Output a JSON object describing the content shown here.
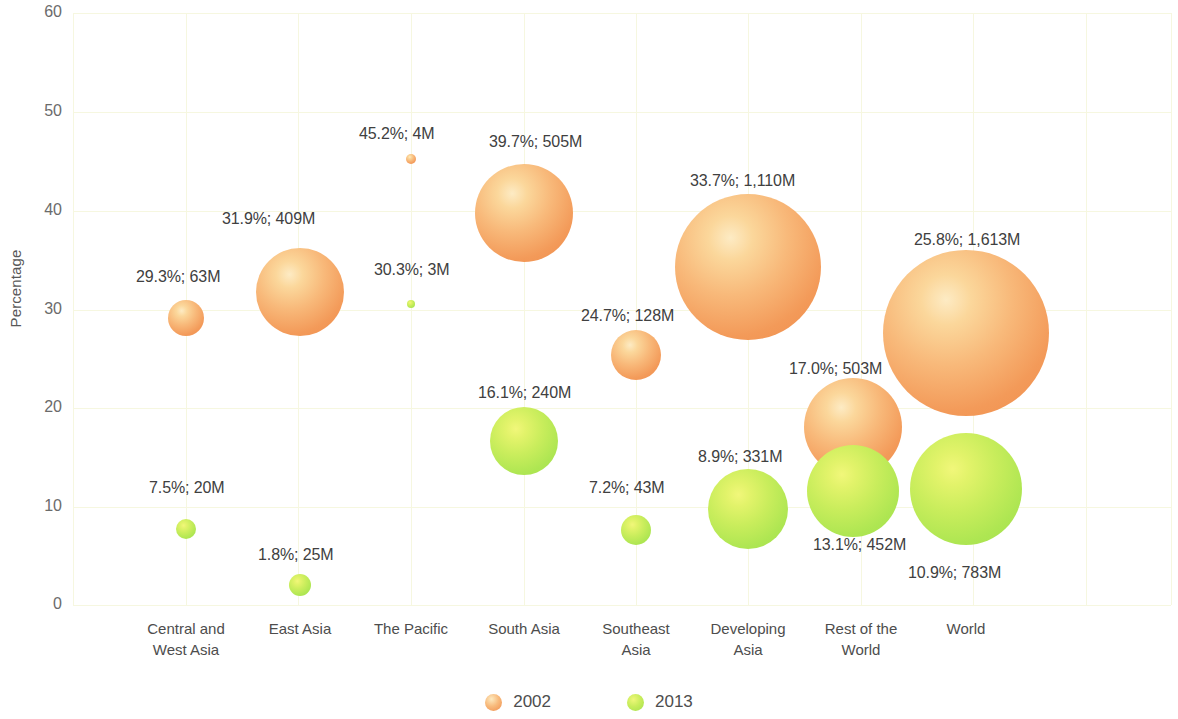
{
  "chart_data": {
    "type": "scatter",
    "title": "",
    "xlabel": "",
    "ylabel": "Percentage",
    "ylim": [
      0,
      60
    ],
    "yticks": [
      "0",
      "10",
      "20",
      "30",
      "40",
      "50",
      "60"
    ],
    "grid": true,
    "legend_position": "bottom",
    "categories": [
      "Central and\nWest Asia",
      "East Asia",
      "The Pacific",
      "South Asia",
      "Southeast\nAsia",
      "Developing\nAsia",
      "Rest of the\nWorld",
      "World"
    ],
    "series": [
      {
        "name": "2002",
        "color": "#ef8d4c",
        "values": [
          29.3,
          31.9,
          45.2,
          39.7,
          24.7,
          33.7,
          17.0,
          25.8
        ],
        "sizes_millions": [
          63,
          409,
          4,
          505,
          128,
          1110,
          503,
          1613
        ],
        "labels": [
          "29.3%; 63M",
          "31.9%; 409M",
          "45.2%; 4M",
          "39.7%; 505M",
          "24.7%; 128M",
          "33.7%; 1,110M",
          "17.0%; 503M",
          "25.8%; 1,613M"
        ]
      },
      {
        "name": "2013",
        "color": "#a3e04c",
        "values": [
          7.5,
          1.8,
          30.3,
          16.1,
          7.2,
          8.9,
          13.1,
          10.9
        ],
        "sizes_millions": [
          20,
          25,
          3,
          240,
          43,
          331,
          452,
          783
        ],
        "labels": [
          "7.5%; 20M",
          "1.8%; 25M",
          "30.3%; 3M",
          "16.1%; 240M",
          "7.2%; 43M",
          "8.9%; 331M",
          "13.1%; 452M",
          "10.9%; 783M"
        ]
      }
    ]
  },
  "axis": {
    "y_title": "Percentage",
    "y_ticks": [
      {
        "label": "60",
        "value": 60
      },
      {
        "label": "50",
        "value": 50
      },
      {
        "label": "40",
        "value": 40
      },
      {
        "label": "30",
        "value": 30
      },
      {
        "label": "20",
        "value": 20
      },
      {
        "label": "10",
        "value": 10
      },
      {
        "label": "0",
        "value": 0
      }
    ],
    "x_ticks": [
      {
        "line1": "Central and",
        "line2": "West Asia"
      },
      {
        "line1": "East Asia",
        "line2": ""
      },
      {
        "line1": "The Pacific",
        "line2": ""
      },
      {
        "line1": "South Asia",
        "line2": ""
      },
      {
        "line1": "Southeast",
        "line2": "Asia"
      },
      {
        "line1": "Developing",
        "line2": "Asia"
      },
      {
        "line1": "Rest of the",
        "line2": "World"
      },
      {
        "line1": "World",
        "line2": ""
      }
    ]
  },
  "legend": {
    "items": [
      {
        "label": "2002",
        "series": "s2002"
      },
      {
        "label": "2013",
        "series": "s2013"
      }
    ]
  },
  "colors": {
    "series_2002": "#ef8d4c",
    "series_2013": "#a3e04c",
    "grid": "#f6f7e0",
    "text": "#4a4a4a"
  },
  "bubbles": [
    {
      "name": "central-west-asia-2002",
      "series": "s2002",
      "cx": 186,
      "cy": 318,
      "r": 18,
      "label": "29.3%; 63M",
      "lx": 136,
      "ly": 268
    },
    {
      "name": "central-west-asia-2013",
      "series": "s2013",
      "cx": 186,
      "cy": 529,
      "r": 10,
      "label": "7.5%; 20M",
      "lx": 149,
      "ly": 479
    },
    {
      "name": "east-asia-2002",
      "series": "s2002",
      "cx": 300,
      "cy": 292,
      "r": 44,
      "label": "31.9%; 409M",
      "lx": 222,
      "ly": 210
    },
    {
      "name": "east-asia-2013",
      "series": "s2013",
      "cx": 300,
      "cy": 585,
      "r": 11,
      "label": "1.8%; 25M",
      "lx": 258,
      "ly": 546
    },
    {
      "name": "the-pacific-2002",
      "series": "s2002",
      "cx": 411,
      "cy": 159,
      "r": 5,
      "label": "45.2%; 4M",
      "lx": 359,
      "ly": 125
    },
    {
      "name": "the-pacific-2013",
      "series": "s2013",
      "cx": 411,
      "cy": 304,
      "r": 4,
      "label": "30.3%; 3M",
      "lx": 374,
      "ly": 261
    },
    {
      "name": "south-asia-2002",
      "series": "s2002",
      "cx": 524,
      "cy": 213,
      "r": 49,
      "label": "39.7%; 505M",
      "lx": 489,
      "ly": 133
    },
    {
      "name": "south-asia-2013",
      "series": "s2013",
      "cx": 524,
      "cy": 441,
      "r": 34,
      "label": "16.1%; 240M",
      "lx": 478,
      "ly": 384
    },
    {
      "name": "southeast-asia-2002",
      "series": "s2002",
      "cx": 636,
      "cy": 355,
      "r": 25,
      "label": "24.7%; 128M",
      "lx": 581,
      "ly": 307
    },
    {
      "name": "southeast-asia-2013",
      "series": "s2013",
      "cx": 636,
      "cy": 530,
      "r": 15,
      "label": "7.2%; 43M",
      "lx": 589,
      "ly": 479
    },
    {
      "name": "developing-asia-2002",
      "series": "s2002",
      "cx": 748,
      "cy": 267,
      "r": 73,
      "label": "33.7%; 1,110M",
      "lx": 690,
      "ly": 172
    },
    {
      "name": "developing-asia-2013",
      "series": "s2013",
      "cx": 748,
      "cy": 509,
      "r": 40,
      "label": "8.9%; 331M",
      "lx": 698,
      "ly": 448
    },
    {
      "name": "rest-of-world-2002",
      "series": "s2002",
      "cx": 853,
      "cy": 427,
      "r": 49,
      "label": "17.0%; 503M",
      "lx": 789,
      "ly": 360
    },
    {
      "name": "rest-of-world-2013",
      "series": "s2013",
      "cx": 853,
      "cy": 491,
      "r": 46,
      "label": "13.1%; 452M",
      "lx": 813,
      "ly": 536
    },
    {
      "name": "world-2002",
      "series": "s2002",
      "cx": 966,
      "cy": 333,
      "r": 83,
      "label": "25.8%; 1,613M",
      "lx": 914,
      "ly": 231
    },
    {
      "name": "world-2013",
      "series": "s2013",
      "cx": 966,
      "cy": 489,
      "r": 56,
      "label": "10.9%; 783M",
      "lx": 908,
      "ly": 564
    }
  ],
  "geometry": {
    "plot_left": 73,
    "plot_top": 13,
    "plot_width": 1098,
    "plot_height": 592,
    "gridlines_y": [
      13,
      112,
      211,
      310,
      408,
      507,
      605
    ],
    "gridlines_x": [
      73,
      186,
      298,
      411,
      524,
      636,
      748,
      861,
      973,
      1086,
      1171
    ]
  }
}
